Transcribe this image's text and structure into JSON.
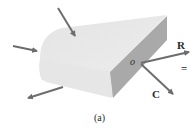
{
  "figure": {
    "caption": "(a)",
    "body": {
      "top_face_color": "#e9e9e9",
      "front_face_color": "#dedede",
      "side_face_color": "#a9a9a9"
    },
    "arrow_color": "#6d6d6d",
    "applied_forces": [
      {
        "name": "force-top",
        "direction": "down-right"
      },
      {
        "name": "force-left",
        "direction": "right"
      },
      {
        "name": "force-bottom-left",
        "direction": "down-left"
      }
    ],
    "point_label": "o",
    "resultant_label": "R",
    "couple_label": "C",
    "equals_sign": "="
  }
}
